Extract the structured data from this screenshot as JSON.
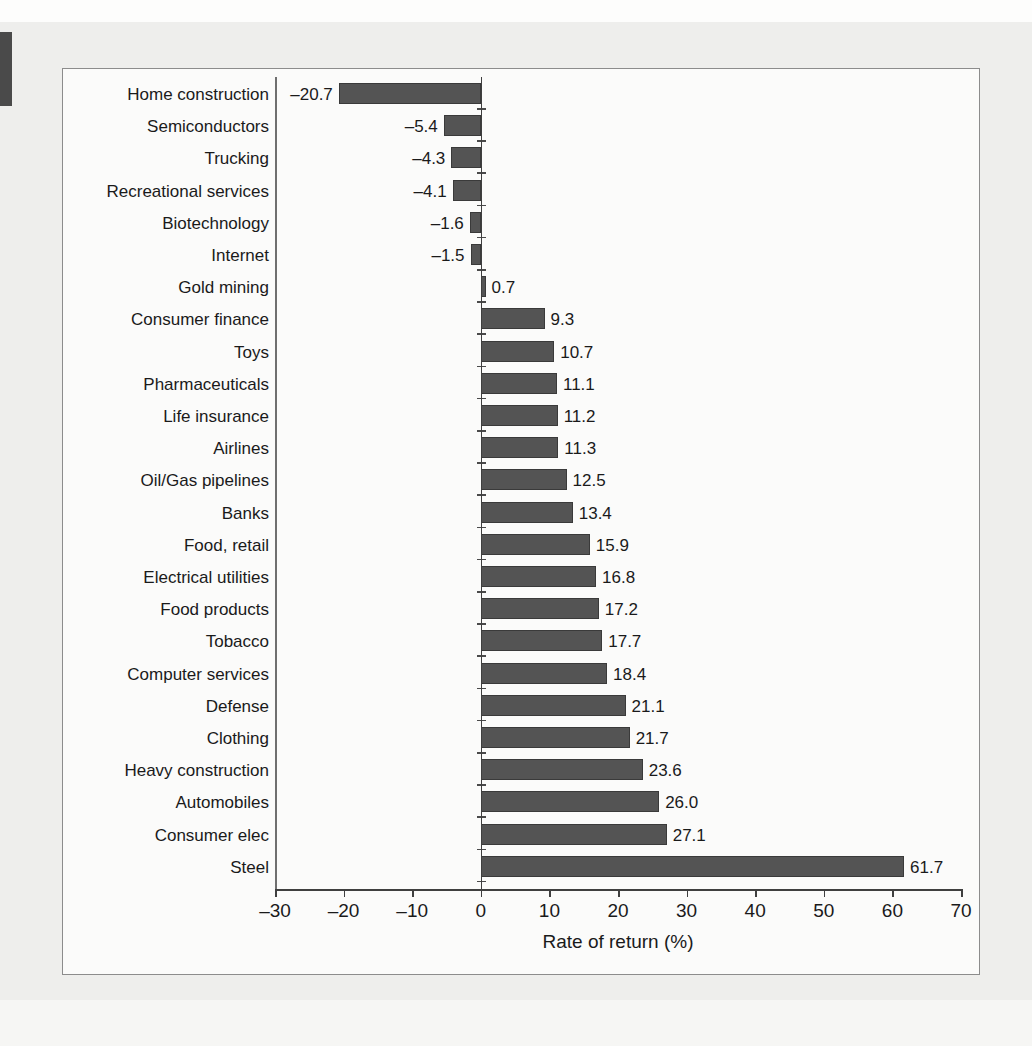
{
  "page": {
    "marker_color": "#4a4a4a",
    "background_color": "#eeeeec",
    "ghost_texts": [
      "A Stock Price Indicators",
      "day, your stockbroker may have mentioned that a stock",
      "or an over-the-counter issue, or perhaps",
      "Why the price for now go up or down?",
      "you are doing it. Fisher is strongly from the common.",
      "power, who are Commodity Prices. Can you find spans",
      "is the question today? the United States has found",
      "Consumer Goods that Fund? Since it",
      "How often the factor the fee of return?",
      "was no to expense is distinguish returns and other than",
      "By a look about Below explains the big dominance?",
      "and a set, but ARE INVESTORS",
      "The Rate of Return is a percentage and the periods",
      "and its investor is repeating it?",
      "year work the great industries in the"
    ]
  },
  "figure": {
    "border_color": "#8c8c8c",
    "bar_fill": "#545454",
    "bar_stroke": "#3a3a3a"
  },
  "chart_data": {
    "type": "bar",
    "orientation": "horizontal",
    "title": "",
    "subtitle": "",
    "xlabel": "Rate of return (%)",
    "ylabel": "",
    "xlim": [
      -30,
      70
    ],
    "xticks": [
      -30,
      -20,
      -10,
      0,
      10,
      20,
      30,
      40,
      50,
      60,
      70
    ],
    "xticklabels": [
      "–30",
      "–20",
      "–10",
      "0",
      "10",
      "20",
      "30",
      "40",
      "50",
      "60",
      "70"
    ],
    "grid": false,
    "legend": false,
    "value_labels_shown": true,
    "categories": [
      "Home construction",
      "Semiconductors",
      "Trucking",
      "Recreational services",
      "Biotechnology",
      "Internet",
      "Gold mining",
      "Consumer finance",
      "Toys",
      "Pharmaceuticals",
      "Life insurance",
      "Airlines",
      "Oil/Gas pipelines",
      "Banks",
      "Food, retail",
      "Electrical utilities",
      "Food products",
      "Tobacco",
      "Computer services",
      "Defense",
      "Clothing",
      "Heavy construction",
      "Automobiles",
      "Consumer elec",
      "Steel"
    ],
    "values": [
      -20.7,
      -5.4,
      -4.3,
      -4.1,
      -1.6,
      -1.5,
      0.7,
      9.3,
      10.7,
      11.1,
      11.2,
      11.3,
      12.5,
      13.4,
      15.9,
      16.8,
      17.2,
      17.7,
      18.4,
      21.1,
      21.7,
      23.6,
      26.0,
      27.1,
      61.7
    ],
    "value_labels": [
      "–20.7",
      "–5.4",
      "–4.3",
      "–4.1",
      "–1.6",
      "–1.5",
      "0.7",
      "9.3",
      "10.7",
      "11.1",
      "11.2",
      "11.3",
      "12.5",
      "13.4",
      "15.9",
      "16.8",
      "17.2",
      "17.7",
      "18.4",
      "21.1",
      "21.7",
      "23.6",
      "26.0",
      "27.1",
      "61.7"
    ]
  }
}
